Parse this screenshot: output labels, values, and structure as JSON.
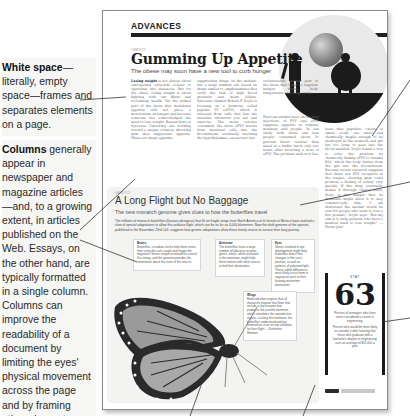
{
  "annotations": {
    "white_space": {
      "term": "White space",
      "text": "—literally, empty space—frames and separates elements on a page."
    },
    "columns": {
      "term": "Columns",
      "text": " generally appear in newspaper and magazine articles—and, to a growing extent, in articles published on the Web. Essays, on the other hand, are typically formatted in a single column. Columns can improve the readability of a document by limiting the eyes' physical movement across the page and by framing other elements."
    }
  },
  "page": {
    "section": "ADVANCES",
    "article1": {
      "kicker": "OBESITY",
      "headline": "Gumming Up Appetite",
      "dek": "The obese may soon have a new tool to curb hunger",
      "lead_in": "Losing weight",
      "col1": " is not always about anticipating outwards oceans or operating into distances. But for the obese, losing weight is about fighting with our fibers and reclaiming health. Yet the primal part of the brain that modulates appetite will not place a moratorium on hunger just because someone has acknowledged the need to lose weight. Researchers at Syracuse University are working toward a unique solution, throwing gum that suppresses appetite. There are many appetite-",
      "col2": "suppressing drugs on the market, but a large number are based on drugs similar to amphetamines that carry the risk of high blood pressure and heart failure. Syracuse chemist Robert P. Doyle is focusing on a hormone called peptide YY (aPYY), which is released from cells that line the intestine whenever you eat and exercise. The more calories consumed, the more aPYY travels from intestinal cells into the bloodstream, eventually reaching the hypothalamus—an ancient site",
      "col3": "evolutionarily ancient part of the brain that helps to regulate hunger, thirst, body temperature and sleep cycles.",
      "col4": "Previous studies have shown that injections of PYY and aPYY suppress appetite in rodents, monkeys and people. In one study, both obese and lean people consumed about 30 percent fewer calories than usual at a buffet lunch only two hours after receiving a dose of aPYY. The problem until now has",
      "col5": "been that peptides, chains of amino acids, are small and chemically fragile enough to be destroyed in the stomach and gut but too large to pass into the blood unaided. Doyle found a way to solve the problem by chemically linking aPYY to vitamin B12, which the body ferries from the gut into the bloodstream. Because recent research suggests that there are PYY receptors in the tongue, chewing gum could promote a feeling of satiety very quickly. If the drug eventually makes it through clinical trials, there is the danger that its dividends might allow it to stay commercially thin. \"I am distressed the market would be vast for people who want to lose a few pounds,\" Doyle says. \"But my aim is to help patients who have a medical need to lose weight.\" —Ferris Jabr"
    },
    "article2": {
      "kicker": "GENETICS",
      "headline": "A Long Flight but No Baggage",
      "dek": "The new monarch genome gives clues to how the butterflies travel",
      "intro": "The millions of monarch butterflies (Danaus plexippus) that flit on fragile wings from North America to fir forests in Mexico have evolved a slew of special adaptations to allow this arduous flight, which can be as far as 4,000 kilometers. Now the draft genome of the species, published in the November 23rd Cell, suggests how genetic adaptations allow these lovely insects to survive their long journey.",
      "callouts": [
        {
          "title": "Brains",
          "text": "Butterflies' circadian clocks help them sense time using the sun's angle and trigger the migration. Genes unique to monarchs control this timing, and the genome provides the information about the route of the insects."
        },
        {
          "title": "Antennae",
          "text": "The butterflies have a large number of olfactory receptor genes, which, when activated in the antennae, might help them interact with other insects to find their destination."
        },
        {
          "title": "Eyes",
          "text": "Genes involved in eye development might help butterflies detect fine changes in the sun's position, as well as patterns of polarized light. These subtle differences most likely assist them in staying on track to their faraway wintertime destination."
        },
        {
          "title": "Wings",
          "text": "Reduced olive engines that all monarchs migrate fast flows that include a key enzyme that produces the juvenile hormone, which stimulates the reproductive organs. Lacking this hormone, the butterflies understand and put themselves in an on-trip condition for their flight. —Katherine Harmon"
        }
      ]
    },
    "stat": {
      "label": "STAT",
      "value": "63",
      "description": "Percent of teenagers who have never considered a career in engineering.",
      "note": "Percent who would be more likely to consider it after learning that those who graduate with a bachelor's degree in engineering earn an average of $55,000 a year."
    },
    "footer": {
      "tag": "COMMENT AT",
      "link": "ScientificAmerican.com/feb2012"
    }
  }
}
